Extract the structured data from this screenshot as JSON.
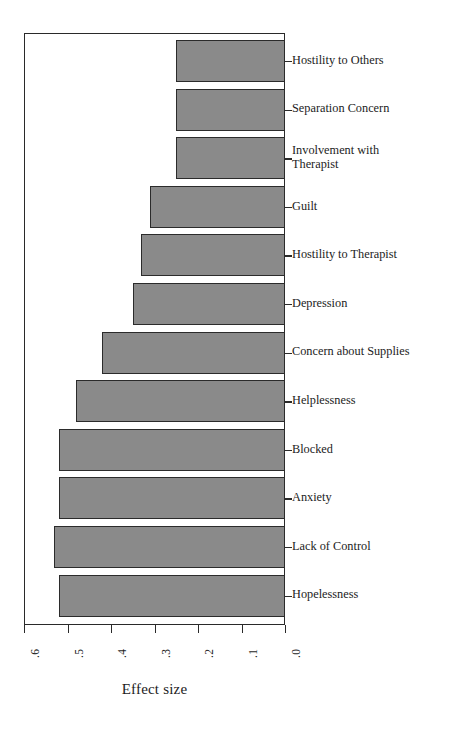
{
  "figure": {
    "background_color": "#ffffff",
    "bar_fill_color": "#8a8a8a",
    "bar_edge_color": "#2b2b2b",
    "axis_color": "#2a2a2a"
  },
  "chart_data": {
    "type": "bar",
    "orientation": "horizontal",
    "title": "",
    "xlabel": "Effect size",
    "ylabel": "",
    "xlim": [
      0.6,
      0.0
    ],
    "x_axis_reversed": true,
    "xticks": [
      0.6,
      0.5,
      0.4,
      0.3,
      0.2,
      0.1,
      0.0
    ],
    "xticklabels": [
      ".6",
      ".5",
      ".4",
      ".3",
      ".2",
      ".1",
      ".0"
    ],
    "grid": false,
    "legend": null,
    "categories": [
      "Hostility to Others",
      "Separation Concern",
      "Involvement with\nTherapist",
      "Guilt",
      "Hostility to Therapist",
      "Depression",
      "Concern about Supplies",
      "Helplessness",
      "Blocked",
      "Anxiety",
      "Lack of Control",
      "Hopelessness"
    ],
    "values": [
      0.25,
      0.25,
      0.25,
      0.31,
      0.33,
      0.35,
      0.42,
      0.48,
      0.52,
      0.52,
      0.53,
      0.52
    ]
  },
  "axis_title": {
    "text": "Effect size"
  }
}
